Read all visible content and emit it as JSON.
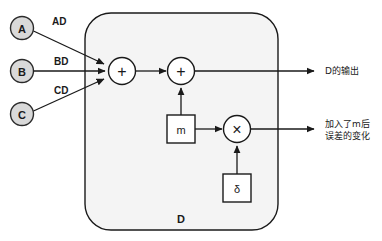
{
  "diagram": {
    "block": {
      "name": "D",
      "fill_color": "#f4f4f4",
      "stroke_color": "#1a1a1a"
    },
    "inputs": [
      {
        "id": "A",
        "label": "A",
        "edge_label": "AD"
      },
      {
        "id": "B",
        "label": "B",
        "edge_label": "BD"
      },
      {
        "id": "C",
        "label": "C",
        "edge_label": "CD"
      }
    ],
    "input_node_style": {
      "fill_color": "#d9d9d9",
      "stroke_color": "#2b2b2b"
    },
    "operators": [
      {
        "id": "sum1",
        "glyph": "+",
        "kind": "summing-junction"
      },
      {
        "id": "sum2",
        "glyph": "+",
        "kind": "summing-junction"
      },
      {
        "id": "mul1",
        "glyph": "×",
        "kind": "multiplier"
      }
    ],
    "boxes": [
      {
        "id": "m",
        "label": "m"
      },
      {
        "id": "delta",
        "label": "δ"
      }
    ],
    "outputs": [
      {
        "id": "out-d",
        "lines": [
          "D的输出"
        ]
      },
      {
        "id": "out-error",
        "lines": [
          "加入了m后",
          "误差的变化"
        ]
      }
    ]
  }
}
